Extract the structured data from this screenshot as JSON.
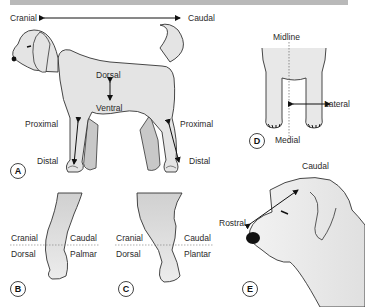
{
  "panels": {
    "A": {
      "badge": "A",
      "labels": {
        "cranial": "Cranial",
        "caudal": "Caudal",
        "dorsal": "Dorsal",
        "ventral": "Ventral",
        "proximal_front": "Proximal",
        "distal_front": "Distal",
        "proximal_hind": "Proximal",
        "distal_hind": "Distal"
      }
    },
    "B": {
      "badge": "B",
      "labels": {
        "cranial": "Cranial",
        "caudal": "Caudal",
        "dorsal": "Dorsal",
        "palmar": "Palmar"
      }
    },
    "C": {
      "badge": "C",
      "labels": {
        "cranial": "Cranial",
        "caudal": "Caudal",
        "dorsal": "Dorsal",
        "plantar": "Plantar"
      }
    },
    "D": {
      "badge": "D",
      "labels": {
        "midline": "Midline",
        "lateral": "Lateral",
        "medial": "Medial"
      }
    },
    "E": {
      "badge": "E",
      "labels": {
        "rostral": "Rostral",
        "caudal": "Caudal"
      }
    }
  },
  "colors": {
    "header_bar": "#b9b9b9",
    "body_fill": "#e4e4e4",
    "shadow_fill": "#c8c8c8",
    "outline": "#333333",
    "nose": "#111111"
  }
}
